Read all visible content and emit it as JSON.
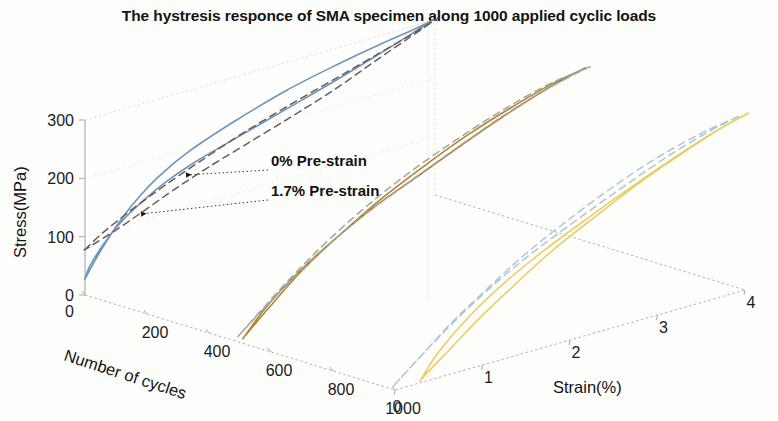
{
  "figure": {
    "title": "The hystresis responce of SMA specimen along 1000 applied cyclic loads",
    "background_color": "#fdfdfc"
  },
  "annotations": [
    {
      "id": "ann0",
      "label": "0% Pre-strain",
      "text_x": 271,
      "text_y": 166,
      "arrow_tip_x": 186,
      "arrow_tip_y": 175,
      "leader_x": 268,
      "leader_y": 170
    },
    {
      "id": "ann17",
      "label": "1.7% Pre-strain",
      "text_x": 271,
      "text_y": 196,
      "arrow_tip_x": 141,
      "arrow_tip_y": 214,
      "leader_x": 268,
      "leader_y": 200
    }
  ],
  "chart_data": {
    "type": "line",
    "title": "The hystresis responce of SMA specimen along 1000 applied cyclic loads",
    "projection": "3d",
    "xlabel": "Number of cycles",
    "ylabel": "Strain(%)",
    "zlabel": "Stress(MPa)",
    "xlim": [
      0,
      1000
    ],
    "ylim": [
      0,
      4
    ],
    "zlim": [
      0,
      300
    ],
    "xticks": [
      0,
      200,
      400,
      600,
      800,
      1000
    ],
    "yticks": [
      0,
      1,
      2,
      3,
      4
    ],
    "zticks": [
      0,
      100,
      200,
      300
    ],
    "grid": true,
    "legend": "none",
    "annotations": [
      "0% Pre-strain",
      "1.7% Pre-strain"
    ],
    "axis_names": {
      "depth_axis": "Number of cycles",
      "horizontal_axis": "Strain(%)",
      "vertical_axis": "Stress(MPa)"
    },
    "tick_text": {
      "stress": [
        "300",
        "200",
        "100",
        "0"
      ],
      "cycles": [
        "0",
        "200",
        "400",
        "600",
        "800",
        "1000"
      ],
      "strain": [
        "0",
        "1",
        "2",
        "3",
        "4"
      ]
    },
    "colors": {
      "cycle_0_solid": "#6d96bb",
      "cycle_0_dashed": "#6c5b5b",
      "cycle_500_solid": "#b5832f",
      "cycle_500_dashed": "#9aa7ae",
      "cycle_1000_solid": "#e9cf63",
      "cycle_1000_dashed": "#a9c6dd"
    },
    "series": [
      {
        "name": "0 cycles - 0% Pre-strain (loading/unloading)",
        "cycle": 0,
        "prestrain_percent": 0,
        "style": "solid",
        "color": "#6d96bb",
        "loading_strain": [
          0.0,
          0.15,
          0.3,
          0.45,
          0.62,
          0.85,
          1.2,
          1.7,
          2.3,
          2.9,
          3.4,
          3.75,
          3.95
        ],
        "loading_stress": [
          28,
          62,
          92,
          118,
          142,
          168,
          196,
          224,
          252,
          272,
          286,
          294,
          300
        ],
        "unloading_strain": [
          3.95,
          3.7,
          3.3,
          2.8,
          2.25,
          1.75,
          1.3,
          0.95,
          0.65,
          0.4,
          0.2,
          0.05,
          0.0
        ],
        "unloading_stress": [
          300,
          286,
          266,
          242,
          218,
          196,
          176,
          156,
          132,
          106,
          76,
          46,
          28
        ]
      },
      {
        "name": "0 cycles - 1.7% Pre-strain (loading/unloading)",
        "cycle": 0,
        "prestrain_percent": 1.7,
        "style": "dashed",
        "color": "#6c5b5b",
        "loading_strain": [
          0.0,
          0.18,
          0.38,
          0.6,
          0.9,
          1.3,
          1.8,
          2.35,
          2.9,
          3.4,
          3.8,
          4.0
        ],
        "loading_stress": [
          78,
          96,
          112,
          128,
          148,
          172,
          200,
          226,
          250,
          272,
          290,
          300
        ],
        "unloading_strain": [
          4.0,
          3.7,
          3.3,
          2.85,
          2.35,
          1.85,
          1.4,
          1.0,
          0.65,
          0.35,
          0.12,
          0.0
        ],
        "unloading_stress": [
          300,
          282,
          258,
          230,
          204,
          180,
          158,
          136,
          114,
          96,
          84,
          78
        ]
      },
      {
        "name": "500 cycles - 0% Pre-strain",
        "cycle": 500,
        "prestrain_percent": 0,
        "style": "solid",
        "color": "#b5832f",
        "loading_strain": [
          0.05,
          0.35,
          0.7,
          1.1,
          1.6,
          2.1,
          2.6,
          3.1,
          3.55,
          3.9
        ],
        "loading_stress": [
          8,
          48,
          92,
          132,
          176,
          212,
          244,
          270,
          290,
          300
        ],
        "unloading_strain": [
          3.9,
          3.5,
          3.0,
          2.5,
          2.0,
          1.5,
          1.05,
          0.65,
          0.3,
          0.05
        ],
        "unloading_stress": [
          300,
          284,
          258,
          228,
          196,
          164,
          128,
          90,
          48,
          8
        ]
      },
      {
        "name": "500 cycles - 1.7% Pre-strain",
        "cycle": 500,
        "prestrain_percent": 1.7,
        "style": "dashed",
        "color": "#9aa7ae",
        "loading_strain": [
          0.0,
          0.3,
          0.65,
          1.05,
          1.55,
          2.05,
          2.55,
          3.05,
          3.55,
          3.95
        ],
        "loading_stress": [
          14,
          52,
          94,
          136,
          180,
          216,
          246,
          272,
          292,
          300
        ],
        "unloading_strain": [
          3.95,
          3.55,
          3.05,
          2.55,
          2.05,
          1.55,
          1.1,
          0.7,
          0.32,
          0.0
        ],
        "unloading_stress": [
          300,
          286,
          262,
          232,
          200,
          168,
          132,
          94,
          52,
          14
        ]
      },
      {
        "name": "1000 cycles - 0% Pre-strain",
        "cycle": 1000,
        "prestrain_percent": 0,
        "style": "solid",
        "color": "#e9cf63",
        "loading_strain": [
          0.3,
          0.6,
          0.95,
          1.35,
          1.8,
          2.3,
          2.8,
          3.3,
          3.7,
          4.0
        ],
        "loading_stress": [
          6,
          40,
          80,
          120,
          162,
          200,
          236,
          266,
          288,
          300
        ],
        "unloading_strain": [
          4.0,
          3.65,
          3.2,
          2.7,
          2.2,
          1.7,
          1.25,
          0.85,
          0.5,
          0.3
        ],
        "unloading_stress": [
          300,
          286,
          262,
          232,
          200,
          166,
          130,
          90,
          44,
          6
        ]
      },
      {
        "name": "1000 cycles - 1.7% Pre-strain",
        "cycle": 1000,
        "prestrain_percent": 1.7,
        "style": "dashed",
        "color": "#a9c6dd",
        "loading_strain": [
          0.0,
          0.3,
          0.65,
          1.05,
          1.5,
          2.0,
          2.5,
          3.0,
          3.5,
          3.9
        ],
        "loading_stress": [
          10,
          46,
          88,
          128,
          170,
          208,
          242,
          270,
          290,
          300
        ],
        "unloading_strain": [
          3.9,
          3.55,
          3.1,
          2.6,
          2.1,
          1.6,
          1.15,
          0.75,
          0.35,
          0.0
        ],
        "unloading_stress": [
          300,
          288,
          266,
          236,
          204,
          170,
          134,
          96,
          52,
          10
        ]
      }
    ]
  }
}
